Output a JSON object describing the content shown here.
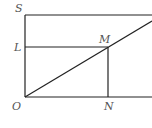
{
  "diagram": {
    "labels": {
      "S": "S",
      "L": "L",
      "M": "M",
      "O": "O",
      "N": "N"
    },
    "points": {
      "O": [
        25,
        97
      ],
      "S": [
        25,
        15
      ],
      "L": [
        25,
        47
      ],
      "M": [
        108,
        47
      ],
      "N": [
        108,
        97
      ]
    },
    "colors": {
      "line": "#222222",
      "label": "#555555"
    }
  }
}
